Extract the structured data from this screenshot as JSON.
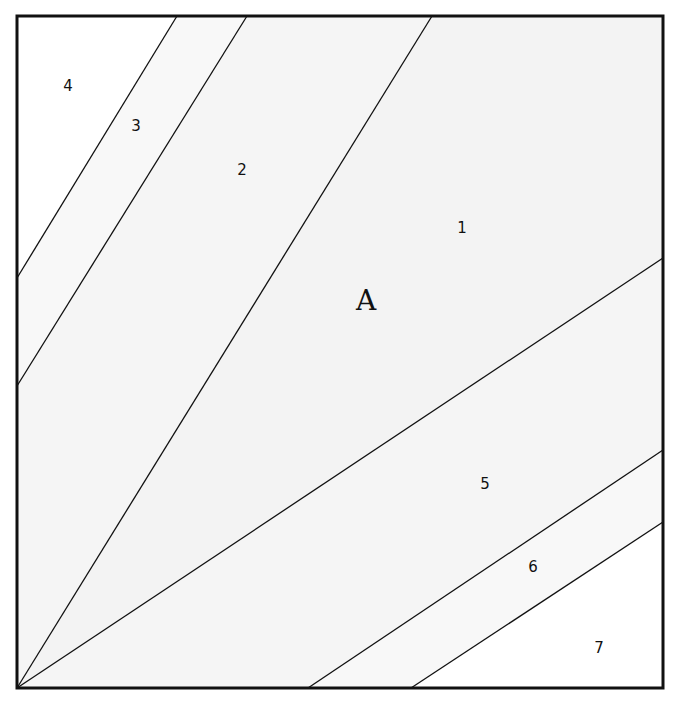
{
  "diagram": {
    "type": "foundation-piecing-block",
    "block_label": "A",
    "frame": {
      "x": 17,
      "y": 16,
      "width": 646,
      "height": 672,
      "stroke": "#111111"
    },
    "colors": {
      "line": "#111111",
      "region_1": "#f3f3f3",
      "region_2": "#f5f5f5",
      "region_3": "#f8f8f8",
      "region_4": "#ffffff",
      "region_5": "#f5f5f5",
      "region_6": "#f8f8f8",
      "region_7": "#ffffff"
    },
    "regions": [
      {
        "id": "1",
        "label": "1",
        "label_x": 462,
        "label_y": 233
      },
      {
        "id": "2",
        "label": "2",
        "label_x": 242,
        "label_y": 175
      },
      {
        "id": "3",
        "label": "3",
        "label_x": 136,
        "label_y": 131
      },
      {
        "id": "4",
        "label": "4",
        "label_x": 68,
        "label_y": 91
      },
      {
        "id": "5",
        "label": "5",
        "label_x": 485,
        "label_y": 489
      },
      {
        "id": "6",
        "label": "6",
        "label_x": 533,
        "label_y": 572
      },
      {
        "id": "7",
        "label": "7",
        "label_x": 599,
        "label_y": 653
      }
    ],
    "main_label": {
      "text": "A",
      "x": 366,
      "y": 310
    }
  }
}
